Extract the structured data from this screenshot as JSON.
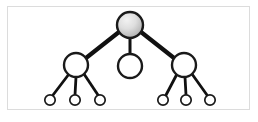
{
  "figure": {
    "title": "Hierarchical tree diagram",
    "width": 258,
    "height": 122,
    "background_color": "#ffffff"
  },
  "frame": {
    "border_color": "#dcdcdc",
    "fill_color": "#ffffff",
    "x": 7,
    "y": 6,
    "width": 243,
    "height": 104
  },
  "style": {
    "edge_color": "#111111",
    "node_stroke_color": "#1a1a1a",
    "node_fill_white": "#ffffff",
    "root_fill_light": "#e8e8e8",
    "root_fill_dark": "#b0b0b0",
    "root_gradient_mid": "#cfcfcf",
    "edge_width_thick": 4.2,
    "edge_width_thin": 2.6,
    "node_stroke_width_large": 2.4,
    "node_stroke_width_small": 1.7
  },
  "chart_data": {
    "type": "diagram",
    "diagram_kind": "tree",
    "title": "Hierarchical tree diagram",
    "levels": 3,
    "node_count": 10,
    "edge_count": 9,
    "nodes": [
      {
        "id": "root",
        "label": "",
        "level": 0,
        "cx": 130,
        "cy": 25,
        "r": 13,
        "fill": "gradient-gray",
        "highlighted": true,
        "children": [
          "mid-left",
          "mid-center",
          "mid-right"
        ]
      },
      {
        "id": "mid-left",
        "label": "",
        "level": 1,
        "cx": 76,
        "cy": 65,
        "r": 12,
        "fill": "white",
        "highlighted": false,
        "children": [
          "leaf-1",
          "leaf-2",
          "leaf-3"
        ]
      },
      {
        "id": "mid-center",
        "label": "",
        "level": 1,
        "cx": 130,
        "cy": 66,
        "r": 12,
        "fill": "white",
        "highlighted": false,
        "children": []
      },
      {
        "id": "mid-right",
        "label": "",
        "level": 1,
        "cx": 184,
        "cy": 65,
        "r": 12,
        "fill": "white",
        "highlighted": false,
        "children": [
          "leaf-4",
          "leaf-5",
          "leaf-6"
        ]
      },
      {
        "id": "leaf-1",
        "label": "",
        "level": 2,
        "cx": 50,
        "cy": 100,
        "r": 5.2,
        "fill": "white",
        "highlighted": false,
        "children": []
      },
      {
        "id": "leaf-2",
        "label": "",
        "level": 2,
        "cx": 75,
        "cy": 100,
        "r": 5.2,
        "fill": "white",
        "highlighted": false,
        "children": []
      },
      {
        "id": "leaf-3",
        "label": "",
        "level": 2,
        "cx": 100,
        "cy": 100,
        "r": 5.2,
        "fill": "white",
        "highlighted": false,
        "children": []
      },
      {
        "id": "leaf-4",
        "label": "",
        "level": 2,
        "cx": 163,
        "cy": 100,
        "r": 5.2,
        "fill": "white",
        "highlighted": false,
        "children": []
      },
      {
        "id": "leaf-5",
        "label": "",
        "level": 2,
        "cx": 186,
        "cy": 100,
        "r": 5.2,
        "fill": "white",
        "highlighted": false,
        "children": []
      },
      {
        "id": "leaf-6",
        "label": "",
        "level": 2,
        "cx": 210,
        "cy": 100,
        "r": 5.2,
        "fill": "white",
        "highlighted": false,
        "children": []
      }
    ],
    "edges": [
      {
        "from": "root",
        "to": "mid-left",
        "x1": 119,
        "y1": 32,
        "x2": 86,
        "y2": 58,
        "width": 4.2
      },
      {
        "from": "root",
        "to": "mid-center",
        "x1": 130,
        "y1": 38,
        "x2": 130,
        "y2": 54,
        "width": 3.0
      },
      {
        "from": "root",
        "to": "mid-right",
        "x1": 141,
        "y1": 32,
        "x2": 174,
        "y2": 58,
        "width": 4.2
      },
      {
        "from": "mid-left",
        "to": "leaf-1",
        "x1": 69,
        "y1": 74,
        "x2": 53,
        "y2": 95,
        "width": 2.8
      },
      {
        "from": "mid-left",
        "to": "leaf-2",
        "x1": 76,
        "y1": 77,
        "x2": 75,
        "y2": 95,
        "width": 2.8
      },
      {
        "from": "mid-left",
        "to": "leaf-3",
        "x1": 84,
        "y1": 74,
        "x2": 98,
        "y2": 95,
        "width": 2.8
      },
      {
        "from": "mid-right",
        "to": "leaf-4",
        "x1": 177,
        "y1": 74,
        "x2": 166,
        "y2": 95,
        "width": 2.8
      },
      {
        "from": "mid-right",
        "to": "leaf-5",
        "x1": 185,
        "y1": 77,
        "x2": 186,
        "y2": 95,
        "width": 2.8
      },
      {
        "from": "mid-right",
        "to": "leaf-6",
        "x1": 192,
        "y1": 74,
        "x2": 207,
        "y2": 95,
        "width": 2.8
      }
    ],
    "annotations": [],
    "legend": []
  }
}
